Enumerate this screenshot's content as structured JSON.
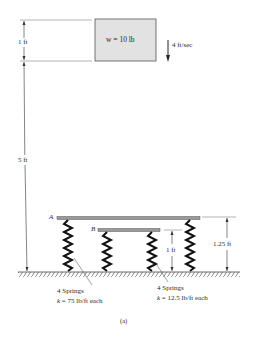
{
  "diagram": {
    "block": {
      "label": "w = 10 lb",
      "fill": "#e2e2e2"
    },
    "velocity": {
      "label": "4 ft/sec",
      "direction": "down"
    },
    "dimensions": {
      "block_height": "1 ft",
      "drop_height": "5 ft",
      "platform_b_height": "1 ft",
      "platform_a_height": "1.25 ft"
    },
    "platforms": {
      "a": {
        "label": "A"
      },
      "b": {
        "label": "B"
      }
    },
    "springs": {
      "outer": {
        "count_label": "4 Springs",
        "k_symbol": "k",
        "k_value": " = 75 lb/ft each"
      },
      "inner": {
        "count_label": "4 Springs",
        "k_symbol": "k",
        "k_value": " = 12.5 lb/ft each"
      }
    },
    "caption": "(a)"
  }
}
